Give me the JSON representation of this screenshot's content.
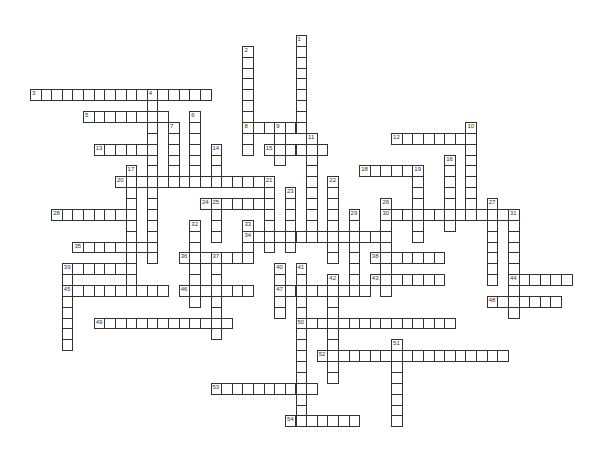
{
  "puzzle": {
    "type": "crossword",
    "grid": {
      "origin_x": 30,
      "origin_y": 35,
      "cell_w": 10.62,
      "cell_h": 10.87
    },
    "words": [
      {
        "number": "1",
        "dir": "down",
        "col": 25,
        "row": 0,
        "length": 9
      },
      {
        "number": "2",
        "dir": "down",
        "col": 20,
        "row": 1,
        "length": 10
      },
      {
        "number": "3",
        "dir": "across",
        "col": 0,
        "row": 5,
        "length": 17
      },
      {
        "number": "4",
        "dir": "down",
        "col": 11,
        "row": 5,
        "length": 16
      },
      {
        "number": "5",
        "dir": "across",
        "col": 5,
        "row": 7,
        "length": 8
      },
      {
        "number": "6",
        "dir": "down",
        "col": 15,
        "row": 7,
        "length": 7
      },
      {
        "number": "7",
        "dir": "down",
        "col": 13,
        "row": 8,
        "length": 6
      },
      {
        "number": "8",
        "dir": "across",
        "col": 20,
        "row": 8,
        "length": 6
      },
      {
        "number": "9",
        "dir": "down",
        "col": 23,
        "row": 8,
        "length": 4
      },
      {
        "number": "10",
        "dir": "down",
        "col": 41,
        "row": 8,
        "length": 9
      },
      {
        "number": "11",
        "dir": "down",
        "col": 26,
        "row": 9,
        "length": 10
      },
      {
        "number": "12",
        "dir": "across",
        "col": 34,
        "row": 9,
        "length": 8
      },
      {
        "number": "13",
        "dir": "across",
        "col": 6,
        "row": 10,
        "length": 6
      },
      {
        "number": "14",
        "dir": "down",
        "col": 17,
        "row": 10,
        "length": 4
      },
      {
        "number": "15",
        "dir": "across",
        "col": 22,
        "row": 10,
        "length": 6
      },
      {
        "number": "16",
        "dir": "down",
        "col": 39,
        "row": 11,
        "length": 7
      },
      {
        "number": "17",
        "dir": "down",
        "col": 9,
        "row": 12,
        "length": 11
      },
      {
        "number": "18",
        "dir": "across",
        "col": 31,
        "row": 12,
        "length": 6
      },
      {
        "number": "19",
        "dir": "down",
        "col": 36,
        "row": 12,
        "length": 7
      },
      {
        "number": "20",
        "dir": "across",
        "col": 8,
        "row": 13,
        "length": 15
      },
      {
        "number": "21",
        "dir": "down",
        "col": 22,
        "row": 13,
        "length": 7
      },
      {
        "number": "22",
        "dir": "down",
        "col": 28,
        "row": 13,
        "length": 8
      },
      {
        "number": "23",
        "dir": "down",
        "col": 24,
        "row": 14,
        "length": 6
      },
      {
        "number": "24",
        "dir": "across",
        "col": 16,
        "row": 15,
        "length": 7
      },
      {
        "number": "25",
        "dir": "down",
        "col": 17,
        "row": 15,
        "length": 4
      },
      {
        "number": "26",
        "dir": "down",
        "col": 33,
        "row": 15,
        "length": 9
      },
      {
        "number": "27",
        "dir": "down",
        "col": 43,
        "row": 15,
        "length": 8
      },
      {
        "number": "28",
        "dir": "across",
        "col": 2,
        "row": 16,
        "length": 8
      },
      {
        "number": "29",
        "dir": "down",
        "col": 30,
        "row": 16,
        "length": 8
      },
      {
        "number": "30",
        "dir": "across",
        "col": 33,
        "row": 16,
        "length": 13
      },
      {
        "number": "31",
        "dir": "down",
        "col": 45,
        "row": 16,
        "length": 10
      },
      {
        "number": "32",
        "dir": "down",
        "col": 15,
        "row": 17,
        "length": 8
      },
      {
        "number": "33",
        "dir": "down",
        "col": 20,
        "row": 17,
        "length": 4
      },
      {
        "number": "34",
        "dir": "across",
        "col": 20,
        "row": 18,
        "length": 14
      },
      {
        "number": "35",
        "dir": "across",
        "col": 4,
        "row": 19,
        "length": 8
      },
      {
        "number": "36",
        "dir": "across",
        "col": 14,
        "row": 20,
        "length": 7
      },
      {
        "number": "37",
        "dir": "down",
        "col": 17,
        "row": 20,
        "length": 8
      },
      {
        "number": "38",
        "dir": "across",
        "col": 32,
        "row": 20,
        "length": 7
      },
      {
        "number": "39",
        "dir": "across",
        "col": 3,
        "row": 21,
        "length": 7
      },
      {
        "number": "39",
        "dir": "down",
        "col": 3,
        "row": 21,
        "length": 8
      },
      {
        "number": "40",
        "dir": "down",
        "col": 23,
        "row": 21,
        "length": 5
      },
      {
        "number": "41",
        "dir": "down",
        "col": 25,
        "row": 21,
        "length": 15
      },
      {
        "number": "42",
        "dir": "down",
        "col": 28,
        "row": 22,
        "length": 10
      },
      {
        "number": "43",
        "dir": "across",
        "col": 32,
        "row": 22,
        "length": 7
      },
      {
        "number": "44",
        "dir": "across",
        "col": 45,
        "row": 22,
        "length": 6
      },
      {
        "number": "45",
        "dir": "across",
        "col": 3,
        "row": 23,
        "length": 10
      },
      {
        "number": "46",
        "dir": "across",
        "col": 14,
        "row": 23,
        "length": 7
      },
      {
        "number": "47",
        "dir": "across",
        "col": 23,
        "row": 23,
        "length": 9
      },
      {
        "number": "48",
        "dir": "across",
        "col": 43,
        "row": 24,
        "length": 7
      },
      {
        "number": "49",
        "dir": "across",
        "col": 6,
        "row": 26,
        "length": 13
      },
      {
        "number": "50",
        "dir": "across",
        "col": 25,
        "row": 26,
        "length": 15
      },
      {
        "number": "51",
        "dir": "down",
        "col": 34,
        "row": 28,
        "length": 8
      },
      {
        "number": "52",
        "dir": "across",
        "col": 27,
        "row": 29,
        "length": 18
      },
      {
        "number": "53",
        "dir": "across",
        "col": 17,
        "row": 32,
        "length": 10
      },
      {
        "number": "54",
        "dir": "across",
        "col": 24,
        "row": 35,
        "length": 7
      }
    ]
  }
}
